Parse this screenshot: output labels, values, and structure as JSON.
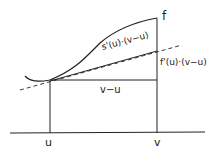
{
  "diagram": {
    "labels": {
      "f": "f",
      "s_term": "s'(u)·(v−u)",
      "f_term": "f'(u)·(v−u)",
      "v_minus_u": "v−u",
      "u": "u",
      "v": "v"
    },
    "colors": {
      "stroke": "#222222",
      "background": "#ffffff"
    }
  }
}
